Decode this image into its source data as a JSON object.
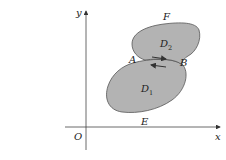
{
  "figure": {
    "axes": {
      "x_label": "x",
      "y_label": "y",
      "origin_label": "O"
    },
    "regions": [
      {
        "name": "D",
        "subscript": "1"
      },
      {
        "name": "D",
        "subscript": "2"
      }
    ],
    "points": {
      "A": "A",
      "B": "B",
      "E": "E",
      "F": "F"
    },
    "arrows": [
      {
        "direction": "right",
        "description": "upper boundary arrow from A to B"
      },
      {
        "direction": "left",
        "description": "lower boundary arrow from B to A"
      }
    ],
    "colors": {
      "region_fill": "#b3b3b3",
      "stroke": "#555555",
      "axis": "#444444"
    }
  }
}
